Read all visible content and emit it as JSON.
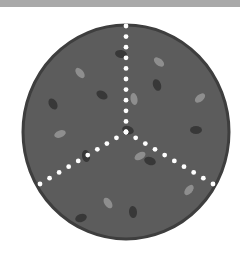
{
  "illustration": {
    "subject": "pizza divided into 3 slices",
    "slice_count": 3,
    "colors": {
      "top_bar": "#a9a9a9",
      "background": "#ffffff",
      "pizza_fill": "#5c5c5c",
      "pizza_border": "#3e3e3e",
      "topping_dark": "#383838",
      "topping_light": "#8e8e8e",
      "cut_dots": "#ffffff"
    },
    "pizza": {
      "cx": 126,
      "cy": 132,
      "rx": 103,
      "ry": 107
    },
    "cut_lines": [
      {
        "x1": 126,
        "y1": 132,
        "x2": 126,
        "y2": 26
      },
      {
        "x1": 126,
        "y1": 132,
        "x2": 40,
        "y2": 184
      },
      {
        "x1": 126,
        "y1": 132,
        "x2": 213,
        "y2": 184
      }
    ],
    "toppings_dark": [
      {
        "x": 121,
        "y": 54,
        "rot": 10
      },
      {
        "x": 157,
        "y": 85,
        "rot": 70
      },
      {
        "x": 102,
        "y": 95,
        "rot": 30
      },
      {
        "x": 53,
        "y": 104,
        "rot": 60
      },
      {
        "x": 196,
        "y": 130,
        "rot": 0
      },
      {
        "x": 128,
        "y": 130,
        "rot": 20
      },
      {
        "x": 86,
        "y": 156,
        "rot": 80
      },
      {
        "x": 150,
        "y": 161,
        "rot": 20
      },
      {
        "x": 81,
        "y": 218,
        "rot": -20
      },
      {
        "x": 133,
        "y": 212,
        "rot": 85
      }
    ],
    "toppings_light": [
      {
        "x": 80,
        "y": 73,
        "rot": 50
      },
      {
        "x": 159,
        "y": 62,
        "rot": 40
      },
      {
        "x": 134,
        "y": 99,
        "rot": 80
      },
      {
        "x": 200,
        "y": 98,
        "rot": -40
      },
      {
        "x": 60,
        "y": 134,
        "rot": -20
      },
      {
        "x": 140,
        "y": 156,
        "rot": -30
      },
      {
        "x": 189,
        "y": 190,
        "rot": -50
      },
      {
        "x": 108,
        "y": 203,
        "rot": 55
      }
    ]
  }
}
